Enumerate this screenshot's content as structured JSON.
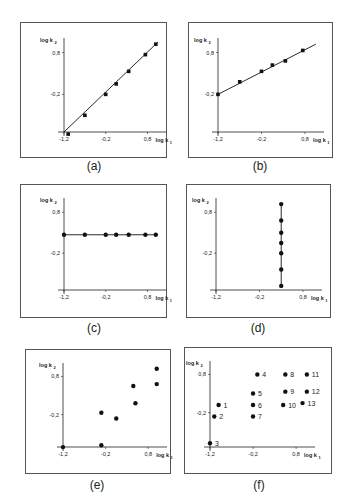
{
  "figure": {
    "panels": [
      {
        "id": "a",
        "caption": "(a)"
      },
      {
        "id": "b",
        "caption": "(b)"
      },
      {
        "id": "c",
        "caption": "(c)"
      },
      {
        "id": "d",
        "caption": "(d)"
      },
      {
        "id": "e",
        "caption": "(e)"
      },
      {
        "id": "f",
        "caption": "(f)"
      }
    ],
    "axis": {
      "xlabel": "log k",
      "xlabel_sub": "1",
      "ylabel": "log k",
      "ylabel_sub": "2",
      "xticks": [
        "-1,2",
        "-0,2",
        "0,8"
      ],
      "yticks": [
        "0,8",
        "-0,2"
      ]
    }
  },
  "chart_data": [
    {
      "panel": "(a)",
      "type": "scatter",
      "fit_line": true,
      "xlabel": "log k1",
      "ylabel": "log k2",
      "xticks": [
        -1.2,
        -0.2,
        0.8
      ],
      "yticks": [
        -0.2,
        0.8
      ],
      "xlim": [
        -1.3,
        1.2
      ],
      "ylim": [
        -1.3,
        1.2
      ],
      "x": [
        -1.1,
        -0.7,
        -0.2,
        0.05,
        0.35,
        0.75,
        1.0
      ],
      "y": [
        -1.15,
        -0.7,
        -0.2,
        0.05,
        0.35,
        0.75,
        1.0
      ],
      "note": "slope ~1 through origin region"
    },
    {
      "panel": "(b)",
      "type": "scatter",
      "fit_line": true,
      "xlabel": "log k1",
      "ylabel": "log k2",
      "xticks": [
        -1.2,
        -0.2,
        0.8
      ],
      "yticks": [
        -0.2,
        0.8
      ],
      "xlim": [
        -1.3,
        1.2
      ],
      "ylim": [
        -1.1,
        1.2
      ],
      "x": [
        -1.2,
        -0.7,
        -0.2,
        0.05,
        0.35,
        0.75
      ],
      "y": [
        -0.2,
        0.1,
        0.35,
        0.5,
        0.6,
        0.85
      ],
      "note": "slope <1, intercept ~-0.2 at x=-1.2"
    },
    {
      "panel": "(c)",
      "type": "scatter",
      "fit_line": true,
      "xlabel": "log k1",
      "ylabel": "log k2",
      "xticks": [
        -1.2,
        -0.2,
        0.8
      ],
      "yticks": [
        -0.2,
        0.8
      ],
      "xlim": [
        -1.3,
        1.2
      ],
      "ylim": [
        -1.1,
        1.2
      ],
      "x": [
        -1.2,
        -0.7,
        -0.2,
        0.05,
        0.35,
        0.75,
        1.0
      ],
      "y": [
        0.25,
        0.25,
        0.25,
        0.25,
        0.25,
        0.25,
        0.25
      ],
      "note": "horizontal line, log k2 constant"
    },
    {
      "panel": "(d)",
      "type": "scatter",
      "fit_line": true,
      "xlabel": "log k1",
      "ylabel": "log k2",
      "xticks": [
        -1.2,
        -0.2,
        0.8
      ],
      "yticks": [
        -0.2,
        0.8
      ],
      "xlim": [
        -1.3,
        1.2
      ],
      "ylim": [
        -1.1,
        1.2
      ],
      "x": [
        0.3,
        0.3,
        0.3,
        0.3,
        0.3,
        0.3,
        0.3
      ],
      "y": [
        -1.0,
        -0.6,
        -0.2,
        0.05,
        0.3,
        0.6,
        1.0
      ],
      "note": "vertical line, log k1 constant"
    },
    {
      "panel": "(e)",
      "type": "scatter",
      "fit_line": false,
      "xlabel": "log k1",
      "ylabel": "log k2",
      "xticks": [
        -1.2,
        -0.2,
        0.8
      ],
      "yticks": [
        -0.2,
        0.8
      ],
      "xlim": [
        -1.3,
        1.2
      ],
      "ylim": [
        -1.1,
        1.2
      ],
      "x": [
        -1.2,
        -0.3,
        -0.3,
        0.05,
        0.45,
        0.5,
        1.0,
        1.0
      ],
      "y": [
        -1.05,
        -1.0,
        -0.15,
        -0.3,
        0.55,
        0.1,
        0.6,
        1.0
      ],
      "note": "no correlation"
    },
    {
      "panel": "(f)",
      "type": "scatter",
      "fit_line": false,
      "xlabel": "log k1",
      "ylabel": "log k2",
      "xticks": [
        -1.2,
        -0.2,
        0.8
      ],
      "yticks": [
        -0.2,
        0.8
      ],
      "xlim": [
        -1.3,
        1.2
      ],
      "ylim": [
        -1.1,
        1.2
      ],
      "points": [
        {
          "label": "1",
          "x": -1.0,
          "y": 0.0
        },
        {
          "label": "2",
          "x": -1.1,
          "y": -0.3
        },
        {
          "label": "3",
          "x": -1.2,
          "y": -1.0
        },
        {
          "label": "4",
          "x": -0.1,
          "y": 0.8
        },
        {
          "label": "5",
          "x": -0.2,
          "y": 0.3
        },
        {
          "label": "6",
          "x": -0.2,
          "y": 0.0
        },
        {
          "label": "7",
          "x": -0.2,
          "y": -0.3
        },
        {
          "label": "8",
          "x": 0.55,
          "y": 0.8
        },
        {
          "label": "9",
          "x": 0.55,
          "y": 0.35
        },
        {
          "label": "10",
          "x": 0.5,
          "y": 0.0
        },
        {
          "label": "11",
          "x": 1.05,
          "y": 0.8
        },
        {
          "label": "12",
          "x": 1.05,
          "y": 0.35
        },
        {
          "label": "13",
          "x": 0.95,
          "y": 0.05
        }
      ]
    }
  ]
}
